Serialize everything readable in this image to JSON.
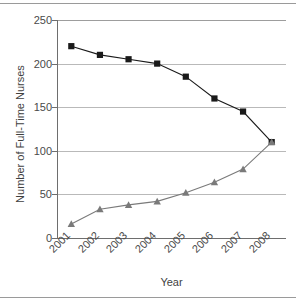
{
  "chart_data": {
    "type": "line",
    "title": "",
    "xlabel": "Year",
    "ylabel": "Number of Full-Time Nurses",
    "categories": [
      "2001",
      "2002",
      "2003",
      "2004",
      "2005",
      "2006",
      "2007",
      "2008"
    ],
    "x_tick_labels": [
      "2001",
      "2002",
      "2003",
      "2004",
      "2005",
      "2006",
      "2007",
      "2008"
    ],
    "y_tick_labels": [
      "0",
      "50",
      "100",
      "150",
      "200",
      "250"
    ],
    "y_ticks": [
      0,
      50,
      100,
      150,
      200,
      250
    ],
    "ylim": [
      0,
      250
    ],
    "grid": "horizontal",
    "legend": "none",
    "series": [
      {
        "name": "declining-series",
        "marker": "square",
        "color": "#1a1a1a",
        "values": [
          220,
          210,
          205,
          200,
          185,
          160,
          145,
          110
        ]
      },
      {
        "name": "rising-series",
        "marker": "triangle",
        "color": "#7a7a7a",
        "values": [
          16,
          33,
          38,
          42,
          52,
          64,
          79,
          110
        ]
      }
    ]
  },
  "colors": {
    "grid": "#b9b9b9",
    "axis": "#6e6e6e",
    "frame_rule": "#9a9a9a",
    "text": "#3f3f3f",
    "series_square": "#1a1a1a",
    "series_triangle": "#7a7a7a"
  }
}
